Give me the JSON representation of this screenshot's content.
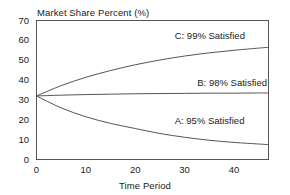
{
  "chart_data": {
    "type": "line",
    "title": "",
    "xlabel": "Time Period",
    "ylabel": "Market Share Percent (%)",
    "xlim": [
      0,
      47
    ],
    "ylim": [
      0,
      70
    ],
    "xticks": [
      0,
      10,
      20,
      30,
      40
    ],
    "yticks": [
      0,
      10,
      20,
      30,
      40,
      50,
      60,
      70
    ],
    "grid": false,
    "legend_position": "inline-annotations",
    "line_color": "#555555",
    "frame_color": "#555555",
    "series": [
      {
        "name": "C: 99% Satisfied",
        "annotation": "C: 99% Satisfied",
        "x": [
          0,
          5,
          10,
          15,
          20,
          25,
          30,
          35,
          40,
          45,
          47
        ],
        "values": [
          32.0,
          37.2,
          41.4,
          44.8,
          47.7,
          50.1,
          52.1,
          53.7,
          55.0,
          56.1,
          56.5
        ]
      },
      {
        "name": "B: 98% Satisfied",
        "annotation": "B: 98% Satisfied",
        "x": [
          0,
          5,
          10,
          15,
          20,
          25,
          30,
          35,
          40,
          45,
          47
        ],
        "values": [
          32.0,
          32.4,
          32.7,
          32.9,
          33.1,
          33.2,
          33.3,
          33.4,
          33.4,
          33.5,
          33.5
        ]
      },
      {
        "name": "A: 95% Satisfied",
        "annotation": "A: 95% Satisfied",
        "x": [
          0,
          5,
          10,
          15,
          20,
          25,
          30,
          35,
          40,
          45,
          47
        ],
        "values": [
          32.0,
          26.0,
          21.5,
          18.2,
          15.6,
          13.1,
          11.2,
          9.7,
          8.6,
          7.8,
          7.5
        ]
      }
    ],
    "annotations": [
      {
        "text": "C: 99% Satisfied",
        "x": 28,
        "y": 62
      },
      {
        "text": "B: 98% Satisfied",
        "x": 42,
        "y": 38.5
      },
      {
        "text": "A: 95% Satisfied",
        "x": 28,
        "y": 19.5
      }
    ]
  }
}
